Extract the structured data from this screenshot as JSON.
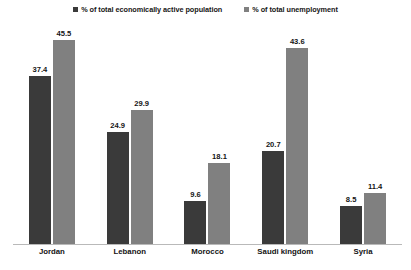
{
  "chart_data": {
    "type": "bar",
    "title": "",
    "xlabel": "",
    "ylabel": "",
    "ylim": [
      0,
      49
    ],
    "grid": false,
    "legend_position": "top-center",
    "categories": [
      "Jordan",
      "Lebanon",
      "Morocco",
      "Saudi kingdom",
      "Syria"
    ],
    "series": [
      {
        "name": "% of total economically active population",
        "color": "#3a3a3a",
        "values": [
          37.4,
          24.9,
          9.6,
          20.7,
          8.5
        ]
      },
      {
        "name": "% of total unemployment",
        "color": "#808080",
        "values": [
          45.5,
          29.9,
          18.1,
          43.6,
          11.4
        ]
      }
    ]
  },
  "legend": {
    "items": [
      {
        "label": "% of total economically active population",
        "swatch": "legend-swatch-series-1"
      },
      {
        "label": "% of total unemployment",
        "swatch": "legend-swatch-series-2"
      }
    ]
  },
  "axis": {
    "baseline_color": "#b9b9b9"
  }
}
